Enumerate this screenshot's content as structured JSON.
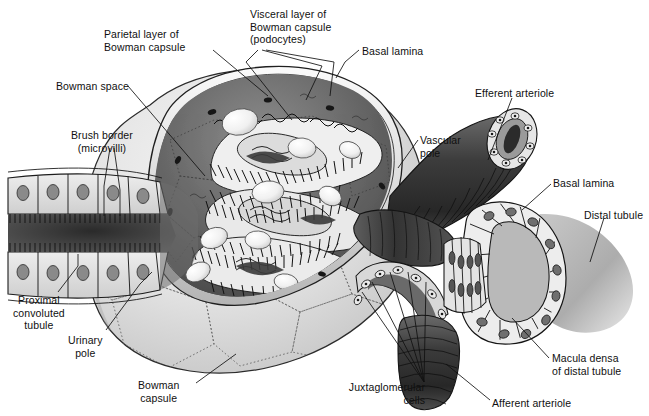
{
  "figure": {
    "background_color": "#ffffff",
    "label_color": "#101010",
    "style": "grayscale pen-and-ink medical illustration"
  },
  "labels": [
    {
      "id": "parietal-layer",
      "text": "Parietal layer of\nBowman capsule",
      "x": 104,
      "y": 28,
      "align": "left"
    },
    {
      "id": "visceral-layer",
      "text": "Visceral layer of\nBowman capsule\n(podocytes)",
      "x": 250,
      "y": 8,
      "align": "left"
    },
    {
      "id": "basal-lamina-top",
      "text": "Basal lamina",
      "x": 362,
      "y": 45,
      "align": "left"
    },
    {
      "id": "bowman-space",
      "text": "Bowman space",
      "x": 56,
      "y": 80,
      "align": "left"
    },
    {
      "id": "efferent-arteriole",
      "text": "Efferent arteriole",
      "x": 475,
      "y": 87,
      "align": "left"
    },
    {
      "id": "brush-border",
      "text": "Brush border\n(microvilli)",
      "x": 76,
      "y": 129,
      "align": "left"
    },
    {
      "id": "vascular-pole",
      "text": "Vascular\npole",
      "x": 420,
      "y": 134,
      "align": "left"
    },
    {
      "id": "basal-lamina-right",
      "text": "Basal lamina",
      "x": 553,
      "y": 177,
      "align": "left"
    },
    {
      "id": "distal-tubule",
      "text": "Distal tubule",
      "x": 584,
      "y": 209,
      "align": "left"
    },
    {
      "id": "proximal-convoluted",
      "text": "Proximal\nconvoluted\ntubule",
      "x": 17,
      "y": 294,
      "align": "left"
    },
    {
      "id": "urinary-pole",
      "text": "Urinary\npole",
      "x": 72,
      "y": 334,
      "align": "left"
    },
    {
      "id": "macula-densa",
      "text": "Macula densa\nof distal tubule",
      "x": 552,
      "y": 352,
      "align": "left"
    },
    {
      "id": "bowman-capsule",
      "text": "Bowman\ncapsule",
      "x": 143,
      "y": 379,
      "align": "left"
    },
    {
      "id": "juxtaglomerular-cells",
      "text": "Juxtaglomerular\ncells",
      "x": 343,
      "y": 381,
      "align": "left"
    },
    {
      "id": "afferent-arteriole",
      "text": "Afferent arteriole",
      "x": 492,
      "y": 397,
      "align": "left"
    }
  ],
  "structures": [
    {
      "id": "bowman-capsule-dome",
      "name": "Bowman capsule outer dome (polygonal squamous cells)"
    },
    {
      "id": "glomerular-tuft",
      "name": "Glomerular capillary tuft with podocyte foot processes"
    },
    {
      "id": "podocyte-bodies",
      "name": "Podocyte cell bodies (pale ovals)"
    },
    {
      "id": "bowman-space-region",
      "name": "Bowman space (dark crescent between layers)"
    },
    {
      "id": "proximal-tubule",
      "name": "Proximal convoluted tubule with brush border"
    },
    {
      "id": "efferent-arteriole-vessel",
      "name": "Efferent arteriole (dark corrugated vessel, upper right)"
    },
    {
      "id": "afferent-arteriole-vessel",
      "name": "Afferent arteriole (dark corrugated vessel, lower right)"
    },
    {
      "id": "distal-tubule-vessel",
      "name": "Distal tubule cut open with columnar epithelium"
    },
    {
      "id": "macula-densa-cells",
      "name": "Macula densa (tall narrow cells of distal tubule)"
    },
    {
      "id": "jg-cells",
      "name": "Juxtaglomerular cells in arteriolar wall"
    }
  ]
}
